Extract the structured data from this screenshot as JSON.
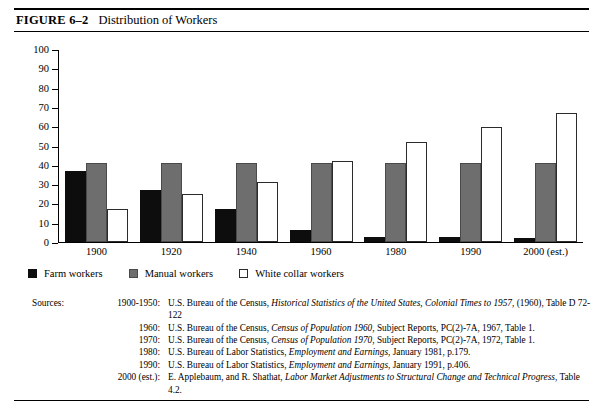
{
  "figure": {
    "label": "FIGURE 6–2",
    "title": "Distribution of Workers"
  },
  "chart_data": {
    "type": "bar",
    "title": "Distribution of Workers",
    "xlabel": "",
    "ylabel": "",
    "ylim": [
      0,
      100
    ],
    "yticks": [
      0,
      10,
      20,
      30,
      40,
      50,
      60,
      70,
      80,
      90,
      100
    ],
    "grid": false,
    "legend_position": "below-left",
    "categories": [
      "1900",
      "1920",
      "1940",
      "1960",
      "1980",
      "1990",
      "2000 (est.)"
    ],
    "series": [
      {
        "name": "Farm workers",
        "color": "#0d0d0d",
        "values": [
          37,
          27,
          17,
          6,
          2.5,
          2.5,
          2
        ]
      },
      {
        "name": "Manual workers",
        "color": "#6e6e6e",
        "values": [
          41,
          41,
          41,
          41,
          41,
          41,
          41
        ]
      },
      {
        "name": "White collar workers",
        "color": "#ffffff",
        "values": [
          17,
          25,
          31,
          42,
          52,
          60,
          67
        ]
      }
    ]
  },
  "legend": {
    "items": [
      {
        "label": "Farm workers"
      },
      {
        "label": "Manual workers"
      },
      {
        "label": "White collar workers"
      }
    ]
  },
  "sources": {
    "heading": "Sources:",
    "rows": [
      {
        "year": "1900-1950:",
        "parts": [
          {
            "t": "U.S. Bureau of the Census, ",
            "i": false
          },
          {
            "t": "Historical Statistics of the United States, Colonial Times to 1957,",
            "i": true
          },
          {
            "t": " (1960), Table D 72-122",
            "i": false
          }
        ]
      },
      {
        "year": "1960:",
        "parts": [
          {
            "t": "U.S. Bureau of the Census, ",
            "i": false
          },
          {
            "t": "Census of Population 1960",
            "i": true
          },
          {
            "t": ", Subject Reports, PC(2)-7A, 1967, Table 1.",
            "i": false
          }
        ]
      },
      {
        "year": "1970:",
        "parts": [
          {
            "t": "U.S. Bureau of the Census, ",
            "i": false
          },
          {
            "t": "Census of Population 1970",
            "i": true
          },
          {
            "t": ", Subject Reports, PC(2)-7A, 1972, Table 1.",
            "i": false
          }
        ]
      },
      {
        "year": "1980:",
        "parts": [
          {
            "t": "U.S. Bureau of Labor Statistics, ",
            "i": false
          },
          {
            "t": "Employment and Earnings",
            "i": true
          },
          {
            "t": ", January 1981, p.179.",
            "i": false
          }
        ]
      },
      {
        "year": "1990:",
        "parts": [
          {
            "t": "U.S. Bureau of Labor Statistics, ",
            "i": false
          },
          {
            "t": "Employment and Earnings",
            "i": true
          },
          {
            "t": ", January 1991, p.406.",
            "i": false
          }
        ]
      },
      {
        "year": "2000 (est.):",
        "parts": [
          {
            "t": "E. Applebaum, and R. Shathat, ",
            "i": false
          },
          {
            "t": "Labor Market Adjustments to Structural Change and  Technical Progress",
            "i": true
          },
          {
            "t": ", Table 4.2.",
            "i": false
          }
        ]
      }
    ]
  }
}
